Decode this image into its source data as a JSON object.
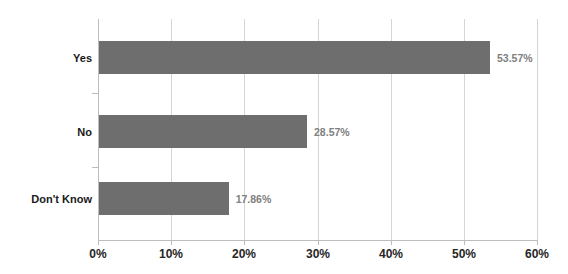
{
  "chart_data": {
    "type": "bar",
    "orientation": "horizontal",
    "title": "",
    "subtitle": "",
    "xlabel": "",
    "ylabel": "",
    "categories": [
      "Yes",
      "No",
      "Don't Know"
    ],
    "values": [
      53.57,
      28.57,
      17.86
    ],
    "value_labels": [
      "53.57%",
      "28.57%",
      "17.86%"
    ],
    "series": [
      {
        "name": "Response",
        "values": [
          53.57,
          28.57,
          17.86
        ]
      }
    ],
    "xlim": [
      0,
      60
    ],
    "x_tick_labels": [
      "0%",
      "10%",
      "20%",
      "30%",
      "40%",
      "50%",
      "60%"
    ],
    "x_tick_values": [
      0,
      10,
      20,
      30,
      40,
      50,
      60
    ],
    "grid": "vertical",
    "legend": "none",
    "colors": {
      "bar": "#6e6e6e",
      "gridline": "#d6d6d6",
      "axis": "#bdbdbd",
      "category_label": "#1a1a1a",
      "value_label": "#808080",
      "tick_label": "#262626",
      "background": "#ffffff"
    }
  },
  "axis": {
    "ticks": [
      {
        "label": "0%"
      },
      {
        "label": "10%"
      },
      {
        "label": "20%"
      },
      {
        "label": "30%"
      },
      {
        "label": "40%"
      },
      {
        "label": "50%"
      },
      {
        "label": "60%"
      }
    ]
  },
  "bars": [
    {
      "category": "Yes",
      "value_label": "53.57%"
    },
    {
      "category": "No",
      "value_label": "28.57%"
    },
    {
      "category": "Don't Know",
      "value_label": "17.86%"
    }
  ]
}
